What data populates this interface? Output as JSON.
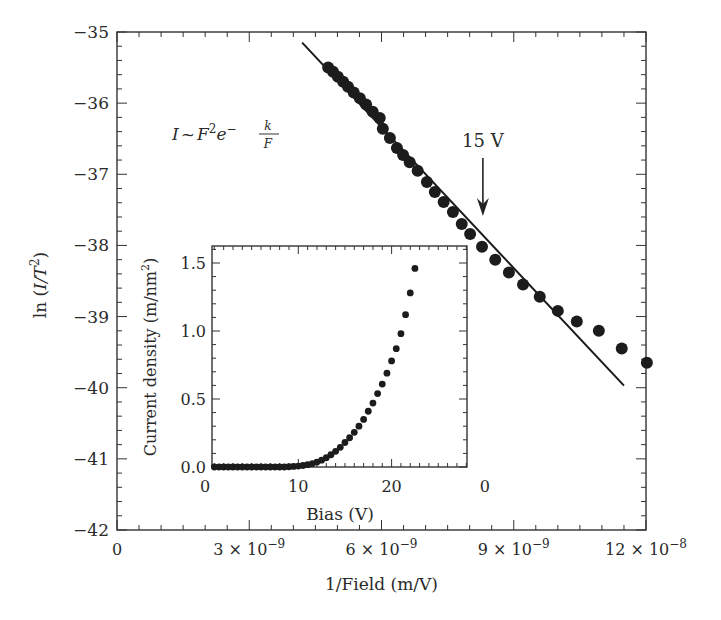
{
  "chart_data": [
    {
      "id": "main",
      "type": "scatter",
      "title": "",
      "xlabel": "1/Field (m/V)",
      "ylabel": "ln (I/T²)",
      "ylabel_parts": {
        "pre": "ln (",
        "italic": "I/T",
        "sup": "2",
        "post": ")"
      },
      "xlim": [
        0,
        1.2e-08
      ],
      "ylim": [
        -42,
        -35
      ],
      "x_ticks": [
        {
          "value": 0,
          "label": "0"
        },
        {
          "value": 3e-09,
          "label": "3 × 10",
          "exp": "−9"
        },
        {
          "value": 6e-09,
          "label": "6 × 10",
          "exp": "−9"
        },
        {
          "value": 9e-09,
          "label": "9 × 10",
          "exp": "−9"
        },
        {
          "value": 1.2e-08,
          "label": "12 × 10",
          "exp": "−8"
        }
      ],
      "y_ticks": [
        {
          "value": -35,
          "label": "−35"
        },
        {
          "value": -36,
          "label": "−36"
        },
        {
          "value": -37,
          "label": "−37"
        },
        {
          "value": -38,
          "label": "−38"
        },
        {
          "value": -39,
          "label": "−39"
        },
        {
          "value": -40,
          "label": "−40"
        },
        {
          "value": -41,
          "label": "−41"
        },
        {
          "value": -42,
          "label": "−42"
        }
      ],
      "grid": false,
      "series": [
        {
          "name": "measured",
          "style": "large-dots",
          "x_1e-9": [
            4.79,
            4.9,
            5.01,
            5.13,
            5.24,
            5.37,
            5.51,
            5.65,
            5.8,
            5.96,
            6.03,
            6.19,
            6.35,
            6.49,
            6.64,
            6.82,
            7.03,
            7.21,
            7.41,
            7.62,
            7.82,
            8.01,
            8.28,
            8.58,
            8.89,
            9.21,
            9.59,
            10.0,
            10.43,
            10.93,
            11.45,
            12.02
          ],
          "y": [
            -35.5,
            -35.56,
            -35.63,
            -35.7,
            -35.77,
            -35.85,
            -35.93,
            -36.02,
            -36.12,
            -36.21,
            -36.36,
            -36.49,
            -36.63,
            -36.73,
            -36.83,
            -36.95,
            -37.11,
            -37.25,
            -37.39,
            -37.53,
            -37.7,
            -37.84,
            -38.02,
            -38.2,
            -38.38,
            -38.55,
            -38.72,
            -38.92,
            -39.07,
            -39.2,
            -39.45,
            -39.65
          ]
        },
        {
          "name": "FN fit",
          "style": "line",
          "x_1e-9": [
            4.2,
            11.5
          ],
          "y": [
            -35.15,
            -39.97
          ]
        }
      ],
      "annotations": [
        {
          "text": "15 V",
          "type": "arrow",
          "x_1e-9": 8.3,
          "y_text": -36.5,
          "y_tip": -37.85
        },
        {
          "type": "equation",
          "text": "I ~ F²e^(−k/F)",
          "parts": {
            "I": "I",
            "tilde": "~",
            "F": "F",
            "sup2": "2",
            "e": "e",
            "minus": "−",
            "num": "k",
            "den": "F"
          }
        }
      ]
    },
    {
      "id": "inset",
      "type": "scatter",
      "title": "",
      "xlabel": "Bias (V)",
      "ylabel": "Current density (m/nm²)",
      "ylabel_parts": {
        "pre": "Current density (m/nm",
        "sup": "2",
        "post": ")"
      },
      "xlim": [
        0.8,
        28.2
      ],
      "ylim": [
        0,
        1.62
      ],
      "x_ticks": [
        {
          "value": 0,
          "label": "0"
        },
        {
          "value": 10,
          "label": "10"
        },
        {
          "value": 20,
          "label": "20"
        },
        {
          "value": 30,
          "label": "0"
        }
      ],
      "y_ticks": [
        {
          "value": 0.0,
          "label": "0.0"
        },
        {
          "value": 0.5,
          "label": "0.5"
        },
        {
          "value": 1.0,
          "label": "1.0"
        },
        {
          "value": 1.5,
          "label": "1.5"
        }
      ],
      "grid": false,
      "series": [
        {
          "name": "J-V",
          "style": "small-dots",
          "x": [
            1.0,
            1.5,
            2.0,
            2.5,
            3.0,
            3.5,
            4.0,
            4.5,
            5.0,
            5.5,
            6.0,
            6.5,
            7.0,
            7.5,
            8.0,
            8.5,
            9.0,
            9.5,
            10.0,
            10.5,
            11.0,
            11.5,
            12.0,
            12.5,
            13.0,
            13.5,
            14.0,
            14.5,
            15.0,
            15.5,
            16.0,
            16.5,
            17.0,
            17.5,
            18.0,
            18.5,
            19.0,
            19.5,
            20.0,
            20.5,
            21.0,
            21.5,
            22.0,
            22.5
          ],
          "y": [
            0.0,
            0.0,
            0.0,
            0.0,
            0.0,
            0.0,
            0.0,
            0.0,
            0.0,
            0.0,
            0.0,
            0.0,
            0.0,
            0.0,
            0.0,
            0.0,
            0.002,
            0.004,
            0.007,
            0.011,
            0.017,
            0.025,
            0.036,
            0.05,
            0.068,
            0.09,
            0.115,
            0.145,
            0.18,
            0.215,
            0.255,
            0.3,
            0.35,
            0.41,
            0.47,
            0.54,
            0.61,
            0.69,
            0.78,
            0.87,
            0.98,
            1.12,
            1.28,
            1.46,
            1.6
          ]
        }
      ]
    }
  ]
}
